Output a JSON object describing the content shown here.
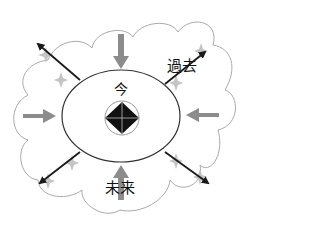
{
  "diagram": {
    "title": "",
    "labels": {
      "center": "今",
      "past": "過去",
      "future": "未来"
    },
    "colors": {
      "cloud_stroke": "#aaaaaa",
      "ellipse_stroke": "#333333",
      "inward_arrow": "#8c8c8c",
      "outward_arrow": "#1a1a1a",
      "sparkle": "#c4c4c4",
      "diamond": "#111111"
    },
    "elements": {
      "outer_shape": "cloud",
      "inner_shape": "ellipse",
      "center_shape": "diamond-in-circle",
      "inward_arrows": [
        "top",
        "left",
        "right",
        "bottom"
      ],
      "outward_arrows": [
        "upper-left",
        "upper-right",
        "lower-left",
        "lower-right"
      ]
    }
  }
}
